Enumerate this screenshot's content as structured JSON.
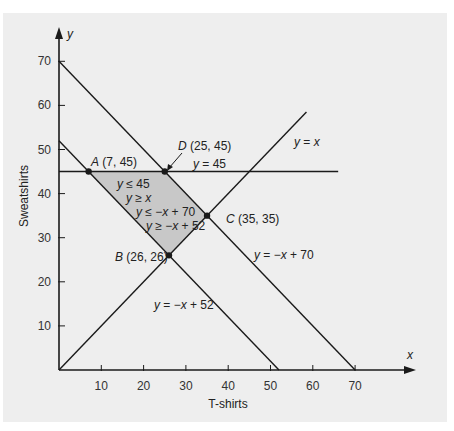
{
  "chart_data": {
    "type": "line",
    "title": "",
    "xlabel": "T-shirts",
    "ylabel": "Sweatshirts",
    "x_axis_var": "x",
    "y_axis_var": "y",
    "xlim": [
      0,
      75
    ],
    "ylim": [
      0,
      75
    ],
    "x_ticks": [
      10,
      20,
      30,
      40,
      50,
      60,
      70
    ],
    "y_ticks": [
      10,
      20,
      30,
      40,
      50,
      60,
      70
    ],
    "x_tick_labels": [
      "10",
      "20",
      "30",
      "40",
      "50",
      "60",
      "70"
    ],
    "y_tick_labels": [
      "10",
      "20",
      "30",
      "40",
      "50",
      "60",
      "70"
    ],
    "grid": false,
    "series": [
      {
        "name": "y = x",
        "label": "y = x",
        "points": [
          [
            0,
            0
          ],
          [
            58.5,
            58.5
          ]
        ]
      },
      {
        "name": "y = 45",
        "label": "y = 45",
        "points": [
          [
            0,
            45
          ],
          [
            66,
            45
          ]
        ]
      },
      {
        "name": "y = -x + 70",
        "label": "y = −x + 70",
        "points": [
          [
            0,
            70
          ],
          [
            70,
            0
          ]
        ]
      },
      {
        "name": "y = -x + 52",
        "label": "y = −x + 52",
        "points": [
          [
            0,
            52
          ],
          [
            52,
            0
          ]
        ]
      }
    ],
    "feasible_region": {
      "vertices": [
        [
          7,
          45
        ],
        [
          25,
          45
        ],
        [
          35,
          35
        ],
        [
          26,
          26
        ]
      ],
      "fill": "#c8c8c8",
      "constraints": [
        "y ≤ 45",
        "y ≥ x",
        "y ≤ −x + 70",
        "y ≥ −x + 52"
      ]
    },
    "points": [
      {
        "name": "A",
        "label_name": "A",
        "label_coords": "(7, 45)",
        "x": 7,
        "y": 45
      },
      {
        "name": "D",
        "label_name": "D",
        "label_coords": "(25, 45)",
        "x": 25,
        "y": 45
      },
      {
        "name": "C",
        "label_name": "C",
        "label_coords": "(35, 35)",
        "x": 35,
        "y": 35
      },
      {
        "name": "B",
        "label_name": "B",
        "label_coords": "(26, 26)",
        "x": 26,
        "y": 26
      }
    ]
  },
  "colors": {
    "panel_background": "#eeeeee",
    "region_fill": "#c8c8c8",
    "line": "#1a1a1a"
  }
}
